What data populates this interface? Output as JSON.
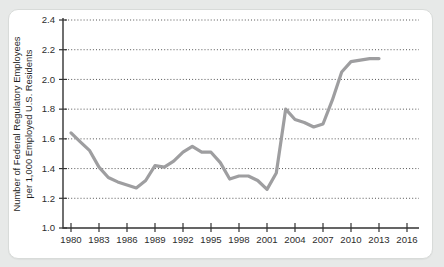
{
  "page": {
    "background_color": "#e7e9e8",
    "card_background": "#ffffff",
    "card_border_color": "#d8dbd9"
  },
  "chart_data": {
    "type": "line",
    "title": "",
    "xlabel": "",
    "ylabel": "Number of Federal Regulatory Employees per 1,000 Employed U.S. Residents",
    "ylabel_lines": [
      "Number of Federal Regulatory Employees",
      "per 1,000 Employed U.S. Residents"
    ],
    "x_tick_labels": [
      "1980",
      "1983",
      "1986",
      "1989",
      "1992",
      "1995",
      "1998",
      "2001",
      "2004",
      "2007",
      "2010",
      "2013",
      "2016"
    ],
    "y_tick_labels": [
      "1.0",
      "1.2",
      "1.4",
      "1.6",
      "1.8",
      "2.0",
      "2.2",
      "2.4"
    ],
    "xlim": [
      1979.1,
      2017.4
    ],
    "ylim": [
      1.0,
      2.4
    ],
    "grid": "horizontal-dotted",
    "legend": "none",
    "line_color": "#9e9ea0",
    "axis_color": "#333333",
    "grid_color": "#555555",
    "label_color": "#2d2d2d",
    "series": [
      {
        "name": "federal-regulatory-employees-per-1000-employed",
        "x": [
          1980,
          1981,
          1982,
          1983,
          1984,
          1985,
          1986,
          1987,
          1988,
          1989,
          1990,
          1991,
          1992,
          1993,
          1994,
          1995,
          1996,
          1997,
          1998,
          1999,
          2000,
          2001,
          2002,
          2003,
          2004,
          2005,
          2006,
          2007,
          2008,
          2009,
          2010,
          2011,
          2012,
          2013
        ],
        "y": [
          1.64,
          1.58,
          1.52,
          1.41,
          1.34,
          1.31,
          1.29,
          1.27,
          1.32,
          1.42,
          1.41,
          1.45,
          1.51,
          1.55,
          1.51,
          1.51,
          1.44,
          1.33,
          1.35,
          1.35,
          1.32,
          1.26,
          1.37,
          1.8,
          1.73,
          1.71,
          1.68,
          1.7,
          1.86,
          2.05,
          2.12,
          2.13,
          2.14,
          2.14
        ]
      }
    ]
  }
}
